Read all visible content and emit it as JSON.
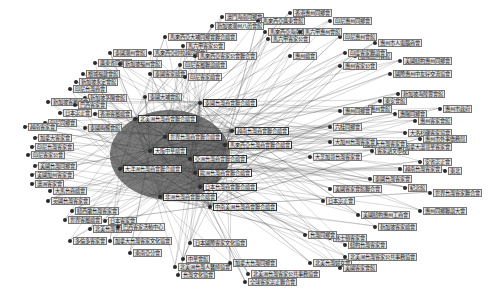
{
  "diagram": {
    "type": "network-graph",
    "colors": {
      "background": "#ffffff",
      "edge": "#3a3a3a",
      "node": "#2a2a2a",
      "label_bg": "#e6e6e6"
    },
    "hub_center": [
      175,
      150
    ],
    "hub_nodes": [
      {
        "label": "北美洲台灣商會聯合總會",
        "x": 135,
        "y": 118
      },
      {
        "label": "世界台灣商會聯合總會",
        "x": 165,
        "y": 136
      },
      {
        "label": "大阪中華總會",
        "x": 150,
        "y": 150
      },
      {
        "label": "亞洲台灣商會聯合總會",
        "x": 190,
        "y": 158
      },
      {
        "label": "歐洲台灣商會聯合總會",
        "x": 195,
        "y": 172
      },
      {
        "label": "大洋洲台灣商會聯合總會",
        "x": 120,
        "y": 168
      },
      {
        "label": "日本台灣商會聯合總會",
        "x": 200,
        "y": 186
      },
      {
        "label": "非洲台灣商會聯合總會",
        "x": 160,
        "y": 196
      },
      {
        "label": "中南美洲台灣商會聯合總會",
        "x": 210,
        "y": 206
      },
      {
        "label": "泰國台灣商會聯合總會",
        "x": 200,
        "y": 102
      },
      {
        "label": "越南台灣商會聯合總會",
        "x": 232,
        "y": 130
      },
      {
        "label": "馬來西亞台灣商會聯合總會",
        "x": 225,
        "y": 144
      }
    ],
    "nodes": [
      {
        "label": "澳門海南同鄉會",
        "x": 222,
        "y": 16
      },
      {
        "label": "馬來西亞廣東會館",
        "x": 258,
        "y": 20
      },
      {
        "label": "新加坡潮州八邑會館",
        "x": 212,
        "y": 25
      },
      {
        "label": "馬來西亞海南會館聯合會",
        "x": 265,
        "y": 31
      },
      {
        "label": "馬六甲客家公會",
        "x": 268,
        "y": 38
      },
      {
        "label": "馬來西亞大埔同鄉會聯合總會",
        "x": 165,
        "y": 36
      },
      {
        "label": "馬六甲客家公會",
        "x": 183,
        "y": 45
      },
      {
        "label": "泰國潮州會館",
        "x": 110,
        "y": 52
      },
      {
        "label": "馬來西亞砂拉越同鄉會",
        "x": 150,
        "y": 52
      },
      {
        "label": "馬來西亞客家公會聯合會",
        "x": 195,
        "y": 55
      },
      {
        "label": "廣東省同鄉會",
        "x": 95,
        "y": 62
      },
      {
        "label": "新加坡福州會館",
        "x": 120,
        "y": 63
      },
      {
        "label": "印尼客屬聯誼總會",
        "x": 180,
        "y": 64
      },
      {
        "label": "檳城福建會館",
        "x": 83,
        "y": 73
      },
      {
        "label": "新加坡永定會館",
        "x": 76,
        "y": 81
      },
      {
        "label": "泰國客家總會",
        "x": 150,
        "y": 73
      },
      {
        "label": "印尼客家總會",
        "x": 185,
        "y": 76
      },
      {
        "label": "印尼台灣商會",
        "x": 70,
        "y": 88
      },
      {
        "label": "新加坡茶陽會館",
        "x": 85,
        "y": 97
      },
      {
        "label": "泰國大埔會館",
        "x": 145,
        "y": 96
      },
      {
        "label": "新加坡客屬總會",
        "x": 48,
        "y": 101
      },
      {
        "label": "巴西客家會",
        "x": 75,
        "y": 104
      },
      {
        "label": "日本崇正會",
        "x": 60,
        "y": 112
      },
      {
        "label": "香港客屬總會",
        "x": 95,
        "y": 113
      },
      {
        "label": "印尼同鄉會",
        "x": 45,
        "y": 122
      },
      {
        "label": "泰國梅縣會館",
        "x": 85,
        "y": 127
      },
      {
        "label": "越南客家會",
        "x": 25,
        "y": 126
      },
      {
        "label": "加拿大客家會",
        "x": 35,
        "y": 137
      },
      {
        "label": "印尼台灣客家會",
        "x": 32,
        "y": 146
      },
      {
        "label": "印尼客家公會",
        "x": 28,
        "y": 154
      },
      {
        "label": "美國台灣同鄉會",
        "x": 35,
        "y": 165
      },
      {
        "label": "美國加州客家會",
        "x": 32,
        "y": 174
      },
      {
        "label": "澳洲客家會",
        "x": 32,
        "y": 183
      },
      {
        "label": "大馬台商總會",
        "x": 50,
        "y": 190
      },
      {
        "label": "英國台灣客家會",
        "x": 48,
        "y": 200
      },
      {
        "label": "紐西蘭台灣客家會",
        "x": 72,
        "y": 210
      },
      {
        "label": "世界客屬總會",
        "x": 65,
        "y": 219
      },
      {
        "label": "日本客家會",
        "x": 105,
        "y": 220
      },
      {
        "label": "北美台灣客家會",
        "x": 90,
        "y": 228
      },
      {
        "label": "巴西客家活動中心",
        "x": 118,
        "y": 226
      },
      {
        "label": "多倫多客家會",
        "x": 70,
        "y": 240
      },
      {
        "label": "加拿大台灣客家文化協會",
        "x": 110,
        "y": 240
      },
      {
        "label": "日本國際客家文化協會",
        "x": 190,
        "y": 242
      },
      {
        "label": "東南亞分會",
        "x": 130,
        "y": 252
      },
      {
        "label": "中華會館",
        "x": 183,
        "y": 258
      },
      {
        "label": "北美洲台灣人醫師協會",
        "x": 175,
        "y": 266
      },
      {
        "label": "加拿大台灣同鄉會",
        "x": 230,
        "y": 262
      },
      {
        "label": "台灣文化協會",
        "x": 178,
        "y": 274
      },
      {
        "label": "北美洲台灣客家公共事務協會",
        "x": 248,
        "y": 273
      },
      {
        "label": "全球客家崇正聯合會",
        "x": 245,
        "y": 281
      },
      {
        "label": "北美台灣婦女會",
        "x": 310,
        "y": 262
      },
      {
        "label": "美國客家會館",
        "x": 340,
        "y": 267
      },
      {
        "label": "北美洲台灣客家公共事務協會",
        "x": 345,
        "y": 256
      },
      {
        "label": "休士頓客家會",
        "x": 330,
        "y": 237
      },
      {
        "label": "紐約台灣客家會",
        "x": 345,
        "y": 244
      },
      {
        "label": "台灣同鄉會",
        "x": 305,
        "y": 234
      },
      {
        "label": "新加坡客家總會",
        "x": 375,
        "y": 226
      },
      {
        "label": "美國紐約惠州工商會",
        "x": 358,
        "y": 214
      },
      {
        "label": "惠州同鄉聯誼大會",
        "x": 420,
        "y": 210
      },
      {
        "label": "日本崇正會",
        "x": 323,
        "y": 200
      },
      {
        "label": "美國客家會館聯合會",
        "x": 330,
        "y": 188
      },
      {
        "label": "世界台灣客家聯合會",
        "x": 430,
        "y": 192
      },
      {
        "label": "紀念館",
        "x": 405,
        "y": 187
      },
      {
        "label": "泰國台灣客家會",
        "x": 370,
        "y": 178
      },
      {
        "label": "東北",
        "x": 445,
        "y": 170
      },
      {
        "label": "越南台灣客家會",
        "x": 400,
        "y": 168
      },
      {
        "label": "安省崇正會",
        "x": 420,
        "y": 161
      },
      {
        "label": "客家語文學校",
        "x": 372,
        "y": 150
      },
      {
        "label": "大芝加哥台灣客家會",
        "x": 310,
        "y": 156
      },
      {
        "label": "加拿大溫哥華客家會",
        "x": 400,
        "y": 146
      },
      {
        "label": "加拿大台灣客家會",
        "x": 360,
        "y": 143
      },
      {
        "label": "大加州台灣客家會",
        "x": 330,
        "y": 141
      },
      {
        "label": "大洛杉磯客家協會",
        "x": 405,
        "y": 132
      },
      {
        "label": "惠州市外事僑務局",
        "x": 420,
        "y": 138
      },
      {
        "label": "六桂同鄉會",
        "x": 330,
        "y": 126
      },
      {
        "label": "惠州客家會館",
        "x": 415,
        "y": 120
      },
      {
        "label": "惠陽同鄉會",
        "x": 395,
        "y": 113
      },
      {
        "label": "惠州市政府",
        "x": 440,
        "y": 108
      },
      {
        "label": "惠州會館",
        "x": 365,
        "y": 108
      },
      {
        "label": "新加坡海陸豐會館",
        "x": 398,
        "y": 93
      },
      {
        "label": "東安會館",
        "x": 380,
        "y": 100
      },
      {
        "label": "惠州同鄉會",
        "x": 340,
        "y": 110
      },
      {
        "label": "國際惠州中友好交流協會",
        "x": 390,
        "y": 73
      },
      {
        "label": "惠州客家公會",
        "x": 340,
        "y": 65
      },
      {
        "label": "美國紐約惠州同鄉會",
        "x": 400,
        "y": 60
      },
      {
        "label": "檳城惠州會館",
        "x": 355,
        "y": 55
      },
      {
        "label": "印度客家聯誼會",
        "x": 345,
        "y": 52
      },
      {
        "label": "惠州市人電腦商會",
        "x": 375,
        "y": 42
      },
      {
        "label": "印尼惠州會館",
        "x": 340,
        "y": 36
      },
      {
        "label": "印尼惠州同鄉會",
        "x": 330,
        "y": 20
      },
      {
        "label": "馬六甲惠州會館",
        "x": 300,
        "y": 31
      },
      {
        "label": "香港惠州同鄉會",
        "x": 290,
        "y": 12
      },
      {
        "label": "惠州總會",
        "x": 290,
        "y": 55
      }
    ]
  }
}
